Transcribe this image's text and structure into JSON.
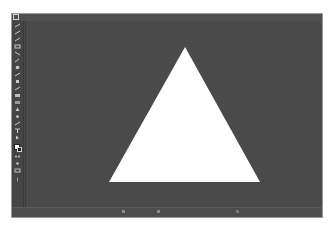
{
  "app": {
    "type": "image-editor"
  },
  "toolbar": {
    "tools": [
      {
        "name": "move-tool",
        "icon": "move-icon"
      },
      {
        "name": "marquee-tool",
        "icon": "marquee-icon"
      },
      {
        "name": "lasso-tool",
        "icon": "lasso-icon"
      },
      {
        "name": "quick-select-tool",
        "icon": "wand-icon"
      },
      {
        "name": "crop-tool",
        "icon": "crop-icon"
      },
      {
        "name": "eyedropper-tool",
        "icon": "eyedropper-icon"
      },
      {
        "name": "healing-tool",
        "icon": "bandage-icon"
      },
      {
        "name": "brush-tool",
        "icon": "brush-icon"
      },
      {
        "name": "stamp-tool",
        "icon": "stamp-icon"
      },
      {
        "name": "history-brush-tool",
        "icon": "history-brush-icon"
      },
      {
        "name": "eraser-tool",
        "icon": "eraser-icon"
      },
      {
        "name": "gradient-tool",
        "icon": "gradient-icon"
      },
      {
        "name": "blur-tool",
        "icon": "blur-icon"
      },
      {
        "name": "dodge-tool",
        "icon": "dodge-icon"
      },
      {
        "name": "pen-tool",
        "icon": "pen-icon"
      },
      {
        "name": "type-tool",
        "icon": "type-icon"
      },
      {
        "name": "path-select-tool",
        "icon": "path-select-icon"
      },
      {
        "name": "shape-tool",
        "icon": "shape-icon"
      },
      {
        "name": "hand-tool",
        "icon": "hand-icon"
      },
      {
        "name": "zoom-tool",
        "icon": "zoom-icon"
      }
    ],
    "colors": {
      "foreground": "#ffffff",
      "background": "#222222"
    }
  },
  "canvas": {
    "background_color": "#4a4a4a",
    "shape": {
      "type": "triangle",
      "fill": "#ffffff",
      "points": "159,26 83,161 234,161"
    }
  },
  "statusbar": {
    "left_text": "",
    "center_text": ""
  },
  "colors": {
    "window_bg": "#4b4b4b",
    "toolbar_bg": "#454545",
    "canvas_bg": "#4a4a4a",
    "shape_fill": "#ffffff"
  }
}
